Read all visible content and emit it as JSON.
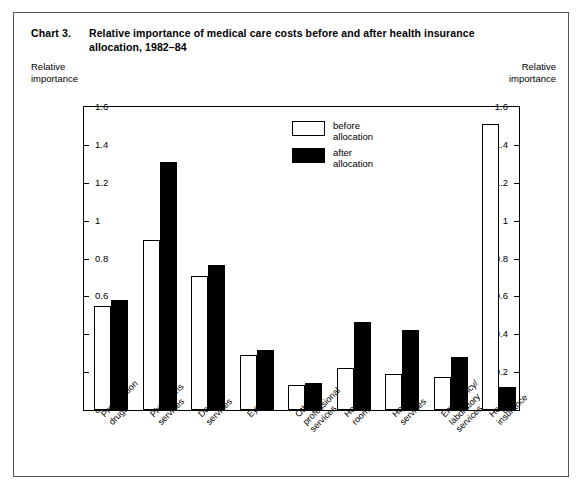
{
  "title": {
    "number": "Chart 3.",
    "text": "Relative importance of medical care costs before and after health insurance allocation, 1982–84"
  },
  "axis_caption_left": "Relative\nimportance",
  "axis_caption_right": "Relative\nimportance",
  "legend": [
    {
      "label": "before\nallocation",
      "swatch": "white-outline"
    },
    {
      "label": "after\nallocation",
      "swatch": "black-fill"
    }
  ],
  "chart_data": {
    "type": "bar",
    "title": "Relative importance of medical care costs before and after health insurance allocation, 1982–84",
    "xlabel": "",
    "ylabel": "Relative importance",
    "ylim": [
      0,
      1.6
    ],
    "yticks": [
      "0",
      "0.2",
      "0.4",
      "0.6",
      "0.8",
      "1",
      "1.2",
      "1.4",
      "1.6"
    ],
    "ytick_values": [
      0,
      0.2,
      0.4,
      0.6,
      0.8,
      1,
      1.2,
      1.4,
      1.6
    ],
    "grid": false,
    "legend_position": "inside-top-center",
    "categories": [
      "Prescription\ndrugs",
      "Physicians\nservices",
      "Dental\nservices",
      "Eyecare",
      "Other\nprofessional\nservices",
      "Hospital\nroom",
      "Hospital\nservices",
      "Emergency/\nlaboratory\nservices",
      "Health\ninsurance"
    ],
    "series": [
      {
        "name": "before allocation",
        "color": "#ffffff",
        "values": [
          0.55,
          0.9,
          0.71,
          0.29,
          0.13,
          0.22,
          0.19,
          0.175,
          1.51
        ]
      },
      {
        "name": "after allocation",
        "color": "#000000",
        "values": [
          0.58,
          1.31,
          0.765,
          0.315,
          0.145,
          0.465,
          0.425,
          0.28,
          0.12
        ]
      }
    ]
  },
  "colors": {
    "before": "#ffffff",
    "after": "#000000",
    "axis": "#000000",
    "frame": "#555555"
  }
}
